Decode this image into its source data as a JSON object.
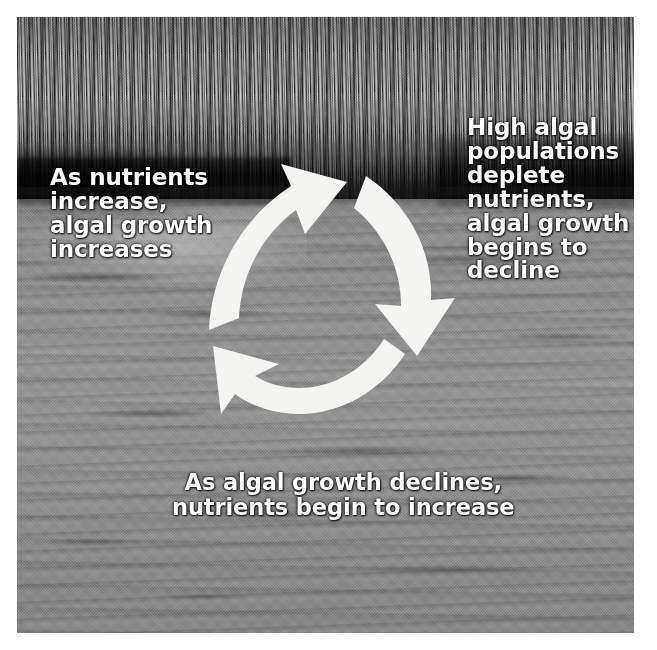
{
  "figure": {
    "background_photo": "marsh-pond-with-reeds-and-algae",
    "palette": {
      "text_color": "#ffffff",
      "arrow_color": "#f2f2f0",
      "photo_border": "#ffffff",
      "water_gray": "#8d8d8d",
      "reed_gray": "#6e6e6e"
    }
  },
  "cycle": {
    "direction": "clockwise",
    "arrow_count": 3,
    "arrows": [
      {
        "id": "arrow-top-left",
        "semantic": "nutrients-to-algal-growth"
      },
      {
        "id": "arrow-right",
        "semantic": "algal-growth-to-nutrient-depletion"
      },
      {
        "id": "arrow-bottom-left",
        "semantic": "decline-to-nutrient-recovery"
      }
    ]
  },
  "captions": {
    "left": "As nutrients\nincrease,\nalgal growth\nincreases",
    "right": "High algal\npopulations\ndeplete\nnutrients,\nalgal growth\nbegins to\ndecline",
    "bottom": "As algal growth declines,\nnutrients begin to increase"
  }
}
